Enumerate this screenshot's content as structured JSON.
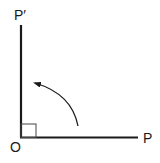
{
  "diagram": {
    "labels": {
      "origin": "O",
      "point": "P",
      "rotated_point": "P′"
    },
    "right_angle_marker": true,
    "rotation_direction": "counterclockwise",
    "colors": {
      "stroke": "#1a1a1a",
      "background": "#ffffff"
    }
  }
}
